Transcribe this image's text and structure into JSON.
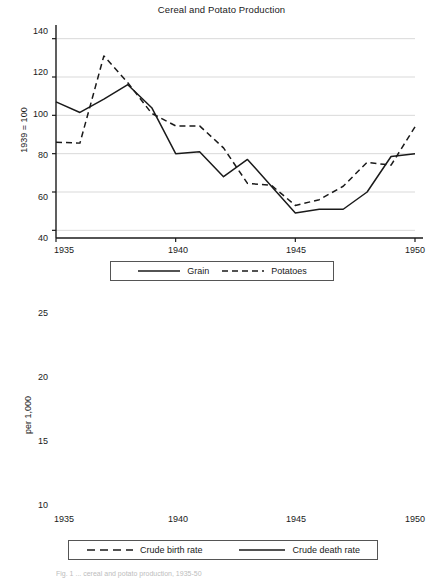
{
  "figure": {
    "width": 443,
    "height": 580,
    "background": "#ffffff",
    "ink_color": "#1a1a1a",
    "grid_color": "#d9d9d9",
    "caption_fragment": "Fig. 1  ... cereal and potato production, 1935-50"
  },
  "chart_data": [
    {
      "type": "line",
      "panel": "top",
      "title": "Cereal and Potato Production",
      "xlabel": "",
      "ylabel": "1939 = 100",
      "x": [
        1935,
        1936,
        1937,
        1938,
        1939,
        1940,
        1941,
        1942,
        1943,
        1944,
        1945,
        1946,
        1947,
        1948,
        1949,
        1950
      ],
      "xlim": [
        1935,
        1950
      ],
      "ylim": [
        36,
        144
      ],
      "xticks": [
        1935,
        1940,
        1945,
        1950
      ],
      "xticklabels": [
        "1935",
        "1940",
        "1945",
        "1950"
      ],
      "yticks": [
        40,
        60,
        80,
        100,
        120,
        140
      ],
      "yticklabels": [
        "40",
        "60",
        "80",
        "100",
        "120",
        "140"
      ],
      "grid": "horizontal",
      "legend_position": "below",
      "series": [
        {
          "name": "Grain",
          "style": "solid",
          "values": [
            107,
            101.5,
            108.5,
            116,
            104,
            80,
            81,
            68,
            77,
            63,
            49,
            51,
            51,
            60,
            78.5,
            80
          ]
        },
        {
          "name": "Potatoes",
          "style": "dashed",
          "values": [
            86,
            85.5,
            131,
            117,
            101,
            94.5,
            94.5,
            83,
            64.5,
            63.5,
            53,
            56,
            63,
            75.5,
            74,
            94
          ]
        }
      ]
    },
    {
      "type": "line",
      "panel": "bottom",
      "title": "",
      "xlabel": "",
      "ylabel": "per 1,000",
      "x": [
        1935,
        1936,
        1937,
        1938,
        1939,
        1940,
        1941,
        1942,
        1943,
        1944,
        1945,
        1946,
        1947,
        1948,
        1949,
        1950
      ],
      "xlim": [
        1935,
        1950
      ],
      "ylim": [
        9.3,
        26.3
      ],
      "xticks": [
        1935,
        1940,
        1945,
        1950
      ],
      "xticklabels": [
        "1935",
        "1940",
        "1945",
        "1950"
      ],
      "yticks": [
        10,
        15,
        20,
        25
      ],
      "yticklabels": [
        "10",
        "15",
        "20",
        "25"
      ],
      "grid": "horizontal",
      "legend_position": "below",
      "series": [
        {
          "name": "Crude birth rate",
          "style": "dashed",
          "values": [
            13.1,
            13.1,
            12.8,
            14.1,
            21.0,
            21.8,
            20.3,
            17.2,
            18.0,
            18.7,
            15.1,
            16.0,
            18.6,
            18.2,
            16.4,
            15.8
          ]
        },
        {
          "name": "Crude death rate",
          "style": "solid",
          "values": [
            13.7,
            13.2,
            13.4,
            14.1,
            15.3,
            15.0,
            14.4,
            13.4,
            13.9,
            16.1,
            25.8,
            13.6,
            13.2,
            12.2,
            13.1,
            12.6
          ]
        }
      ]
    }
  ],
  "legends": {
    "top": [
      {
        "label": "Grain",
        "style": "solid"
      },
      {
        "label": "Potatoes",
        "style": "dashed"
      }
    ],
    "bottom": [
      {
        "label": "Crude birth rate",
        "style": "dashed"
      },
      {
        "label": "Crude death rate",
        "style": "solid"
      }
    ]
  }
}
